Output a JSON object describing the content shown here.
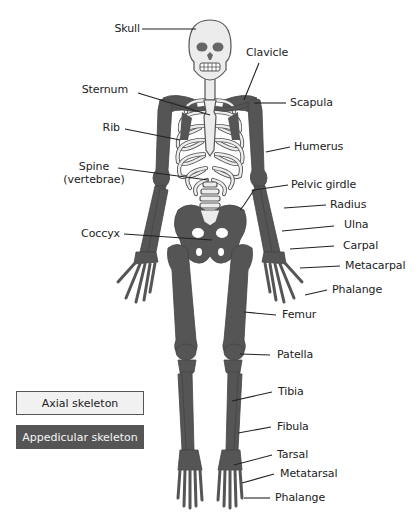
{
  "diagram": {
    "type": "labeled-anatomy"
  },
  "colors": {
    "axial": "#ececec",
    "axial_outline": "#555555",
    "appendicular": "#555555",
    "leader": "#222222",
    "text": "#222222"
  },
  "labels": {
    "skull": "Skull",
    "clavicle": "Clavicle",
    "sternum": "Sternum",
    "scapula": "Scapula",
    "rib": "Rib",
    "humerus": "Humerus",
    "spine_line1": "Spine",
    "spine_line2": "(vertebrae)",
    "pelvic_girdle": "Pelvic girdle",
    "radius": "Radius",
    "ulna": "Ulna",
    "coccyx": "Coccyx",
    "carpal": "Carpal",
    "metacarpal": "Metacarpal",
    "phalange_hand": "Phalange",
    "femur": "Femur",
    "patella": "Patella",
    "tibia": "Tibia",
    "fibula": "Fibula",
    "tarsal": "Tarsal",
    "metatarsal": "Metatarsal",
    "phalange_foot": "Phalange"
  },
  "legend": {
    "axial": "Axial skeleton",
    "appendicular": "Appedicular skeleton"
  }
}
